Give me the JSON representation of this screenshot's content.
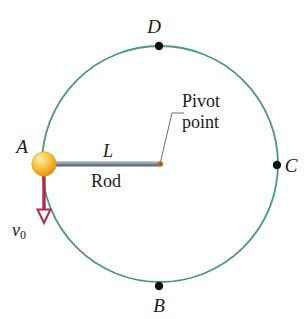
{
  "figure": {
    "type": "physics-diagram",
    "background_color": "#ffffff",
    "width": 307,
    "height": 319
  },
  "colors": {
    "circle_stroke": "#4a9b70",
    "rod_fill": "#6b7583",
    "rod_highlight": "#9aa3ae",
    "ball_core": "#f5c242",
    "ball_edge": "#e39a1c",
    "ball_highlight": "#fde9b0",
    "pivot_dot": "#b5722a",
    "velocity_arrow": "#b02a4a",
    "marker_dot": "#111111",
    "leader_line": "#6e6e6e",
    "text": "#1a1a1a"
  },
  "geometry": {
    "circle": {
      "cx": 160,
      "cy": 164,
      "r": 118,
      "stroke_width": 1.8
    },
    "ball": {
      "cx": 44,
      "cy": 164,
      "r": 12
    },
    "pivot": {
      "cx": 160,
      "cy": 164,
      "r": 2.6
    },
    "rod": {
      "x1": 48,
      "y1": 164,
      "x2": 160,
      "y2": 164,
      "thickness": 5
    },
    "velocity_arrow": {
      "x": 44,
      "y_start": 176,
      "y_end": 213,
      "head_width": 13,
      "head_height": 13
    },
    "leader_line": {
      "points": "160,164 172,113 184,113"
    },
    "markers": [
      {
        "name": "D",
        "cx": 159,
        "cy": 46
      },
      {
        "name": "C",
        "cx": 277,
        "cy": 165
      },
      {
        "name": "B",
        "cx": 159,
        "cy": 286
      }
    ]
  },
  "labels": {
    "point_a": "A",
    "point_b": "B",
    "point_c": "C",
    "point_d": "D",
    "rod_length": "L",
    "rod_name": "Rod",
    "pivot_line1": "Pivot",
    "pivot_line2": "point",
    "velocity_symbol": "v",
    "velocity_subscript": "0"
  }
}
